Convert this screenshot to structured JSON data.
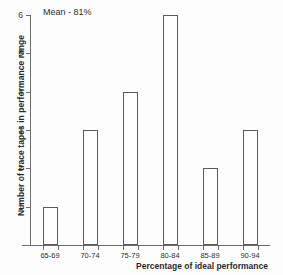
{
  "chart_data": {
    "type": "bar",
    "title": "",
    "annotation": "Mean - 81%",
    "xlabel": "Percentage of ideal performance",
    "ylabel": "Number of trace tapes in performance range",
    "categories": [
      "65-69",
      "70-74",
      "75-79",
      "80-84",
      "85-89",
      "90-94"
    ],
    "values": [
      1,
      3,
      4,
      6,
      2,
      3
    ],
    "ylim": [
      0,
      6
    ],
    "yticks": [
      1,
      2,
      3,
      4,
      5,
      6
    ],
    "ytick_labels": [
      "1",
      "2",
      "3",
      "4",
      "5",
      "6"
    ],
    "grid": false,
    "legend": null,
    "bar_style": {
      "fill": "#ffffff",
      "edge": "#5a5a5a"
    }
  }
}
